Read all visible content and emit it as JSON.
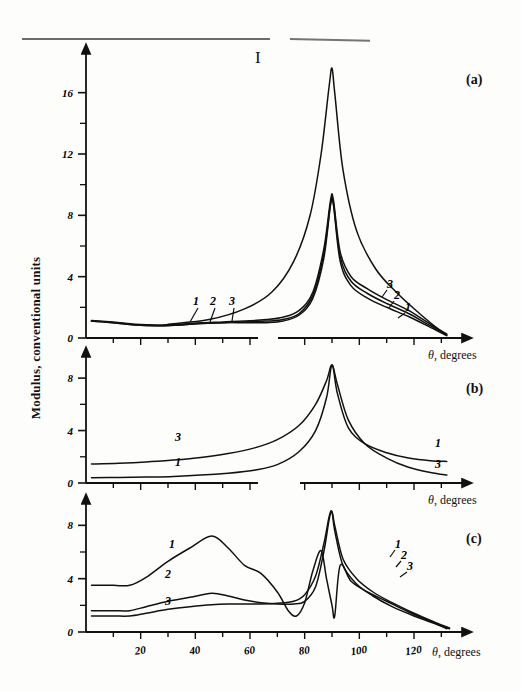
{
  "figure": {
    "roman_numeral": "I",
    "ylabel": "Modulus, conventional units",
    "panels": [
      {
        "id": "a",
        "label": "(a)"
      },
      {
        "id": "b",
        "label": "(b)"
      },
      {
        "id": "c",
        "label": "(c)"
      }
    ],
    "xaxis_caption_theta": "θ",
    "xaxis_caption_rest": ", degrees"
  },
  "ticks": {
    "x": [
      "20",
      "40",
      "60",
      "80",
      "100",
      "120"
    ],
    "y_a": [
      "0",
      "4",
      "8",
      "12",
      "16"
    ],
    "y_b": [
      "0",
      "4",
      "8"
    ],
    "y_c": [
      "0",
      "4",
      "8"
    ]
  },
  "curve_labels": {
    "a_left": [
      "1",
      "2",
      "3"
    ],
    "a_right": [
      "3",
      "2",
      "1"
    ],
    "b_left": [
      "3",
      "1"
    ],
    "b_right": [
      "1",
      "3"
    ],
    "c_left": [
      "1",
      "2",
      "3"
    ],
    "c_right": [
      "1",
      "2",
      "3"
    ]
  },
  "colors": {
    "ink": "#111111",
    "paper": "#fdfdfb"
  },
  "chart_data": {
    "type": "line",
    "title": "",
    "subtitle": "I",
    "xlabel": "θ, degrees",
    "ylabel": "Modulus, conventional units",
    "grid": false,
    "legend": "inline curve numbers 1, 2, 3",
    "xlim": [
      0,
      135
    ],
    "xticks": [
      20,
      40,
      60,
      80,
      100,
      120
    ],
    "panels": [
      {
        "id": "a",
        "label": "(a)",
        "ylim": [
          0,
          18
        ],
        "yticks": [
          0,
          4,
          8,
          12,
          16
        ],
        "yminor": [
          2,
          6,
          10,
          14
        ],
        "note": "sharp resonance spike at ~90 deg reaching ~17.5; secondary peaks ~8.7",
        "series": [
          {
            "name": "1",
            "x": [
              2,
              10,
              18,
              26,
              34,
              42,
              50,
              58,
              66,
              72,
              78,
              83,
              87,
              89.5,
              90.5,
              93,
              97,
              103,
              110,
              118,
              126,
              132
            ],
            "y": [
              1.1,
              1.0,
              0.85,
              0.8,
              0.85,
              0.95,
              1.0,
              1.0,
              1.0,
              1.1,
              1.5,
              2.6,
              5.2,
              8.7,
              8.7,
              5.0,
              3.4,
              2.6,
              2.0,
              1.4,
              0.7,
              0.15
            ]
          },
          {
            "name": "2",
            "x": [
              2,
              10,
              18,
              26,
              34,
              42,
              50,
              58,
              66,
              72,
              78,
              83,
              87,
              89.5,
              90.5,
              93,
              97,
              103,
              110,
              118,
              126,
              132
            ],
            "y": [
              1.1,
              1.0,
              0.85,
              0.8,
              0.85,
              0.95,
              1.0,
              1.05,
              1.1,
              1.2,
              1.6,
              2.8,
              5.5,
              8.8,
              8.8,
              5.3,
              3.7,
              2.9,
              2.25,
              1.6,
              0.8,
              0.2
            ]
          },
          {
            "name": "3",
            "x": [
              2,
              10,
              18,
              26,
              34,
              42,
              50,
              58,
              66,
              72,
              78,
              83,
              87,
              89.5,
              90.5,
              93,
              97,
              103,
              110,
              118,
              126,
              132
            ],
            "y": [
              1.15,
              1.05,
              0.9,
              0.85,
              0.9,
              1.0,
              1.05,
              1.1,
              1.2,
              1.35,
              1.8,
              3.0,
              5.8,
              9.0,
              9.0,
              5.6,
              4.0,
              3.2,
              2.5,
              1.8,
              0.9,
              0.25
            ]
          },
          {
            "name": "main-resonance",
            "x": [
              30,
              45,
              58,
              68,
              76,
              82,
              86,
              89,
              90,
              91,
              94,
              99,
              106,
              114,
              122,
              130
            ],
            "y": [
              0.9,
              1.2,
              1.9,
              3.0,
              5.0,
              8.0,
              12.0,
              16.5,
              17.6,
              16.0,
              11.0,
              7.0,
              4.5,
              2.9,
              1.6,
              0.4
            ]
          }
        ]
      },
      {
        "id": "b",
        "label": "(b)",
        "ylim": [
          0,
          9
        ],
        "yticks": [
          0,
          4,
          8
        ],
        "yminor": [
          2,
          6
        ],
        "note": "two smooth Lorentzian-like curves diverging at ~90 deg",
        "series": [
          {
            "name": "1",
            "x": [
              2,
              12,
              22,
              32,
              42,
              52,
              62,
              70,
              78,
              84,
              88,
              90,
              92,
              96,
              102,
              110,
              118,
              126,
              132
            ],
            "y": [
              0.4,
              0.42,
              0.45,
              0.5,
              0.6,
              0.75,
              1.0,
              1.4,
              2.4,
              4.0,
              6.5,
              9.0,
              6.8,
              4.2,
              3.0,
              2.3,
              1.9,
              1.7,
              1.65
            ]
          },
          {
            "name": "3",
            "x": [
              2,
              12,
              22,
              32,
              42,
              52,
              62,
              70,
              78,
              84,
              88,
              90,
              92,
              96,
              102,
              110,
              118,
              126,
              132
            ],
            "y": [
              1.45,
              1.5,
              1.6,
              1.75,
              1.95,
              2.25,
              2.7,
              3.3,
              4.4,
              6.0,
              7.8,
              9.0,
              7.5,
              4.8,
              3.0,
              1.9,
              1.2,
              0.8,
              0.6
            ]
          }
        ]
      },
      {
        "id": "c",
        "label": "(c)",
        "ylim": [
          0,
          9
        ],
        "yticks": [
          0,
          4,
          8
        ],
        "yminor": [
          2,
          6
        ],
        "note": "oscillatory structure; curve 1 broad max ~7.2 near 46 deg, sharp dips and spikes 70-95 deg",
        "series": [
          {
            "name": "1",
            "x": [
              2,
              10,
              16,
              22,
              30,
              38,
              46,
              52,
              58,
              64,
              70,
              74,
              77,
              80,
              83,
              86,
              88,
              90,
              91,
              93,
              97,
              103,
              110,
              118,
              126,
              132
            ],
            "y": [
              3.5,
              3.5,
              3.5,
              4.1,
              5.3,
              6.3,
              7.2,
              6.3,
              5.0,
              4.4,
              3.0,
              1.6,
              1.2,
              2.2,
              4.6,
              6.1,
              4.0,
              2.0,
              1.2,
              5.0,
              3.8,
              3.0,
              2.3,
              1.5,
              0.8,
              0.25
            ]
          },
          {
            "name": "2",
            "x": [
              2,
              10,
              16,
              22,
              30,
              38,
              46,
              52,
              58,
              64,
              70,
              76,
              80,
              84,
              87,
              89,
              90,
              91,
              94,
              99,
              105,
              112,
              120,
              128,
              133
            ],
            "y": [
              1.6,
              1.6,
              1.6,
              1.9,
              2.3,
              2.6,
              2.9,
              2.7,
              2.4,
              2.2,
              2.1,
              2.1,
              2.3,
              3.4,
              6.0,
              8.5,
              9.0,
              8.0,
              5.5,
              4.0,
              3.0,
              2.2,
              1.4,
              0.7,
              0.3
            ]
          },
          {
            "name": "3",
            "x": [
              2,
              10,
              16,
              22,
              30,
              38,
              46,
              52,
              58,
              64,
              70,
              76,
              80,
              84,
              87,
              89,
              90,
              91,
              94,
              99,
              105,
              112,
              120,
              128,
              133
            ],
            "y": [
              1.2,
              1.2,
              1.2,
              1.4,
              1.7,
              1.9,
              2.05,
              2.1,
              2.1,
              2.1,
              2.15,
              2.3,
              2.8,
              4.2,
              6.6,
              8.7,
              9.0,
              7.6,
              5.0,
              3.6,
              2.7,
              1.9,
              1.2,
              0.6,
              0.25
            ]
          }
        ]
      }
    ]
  }
}
